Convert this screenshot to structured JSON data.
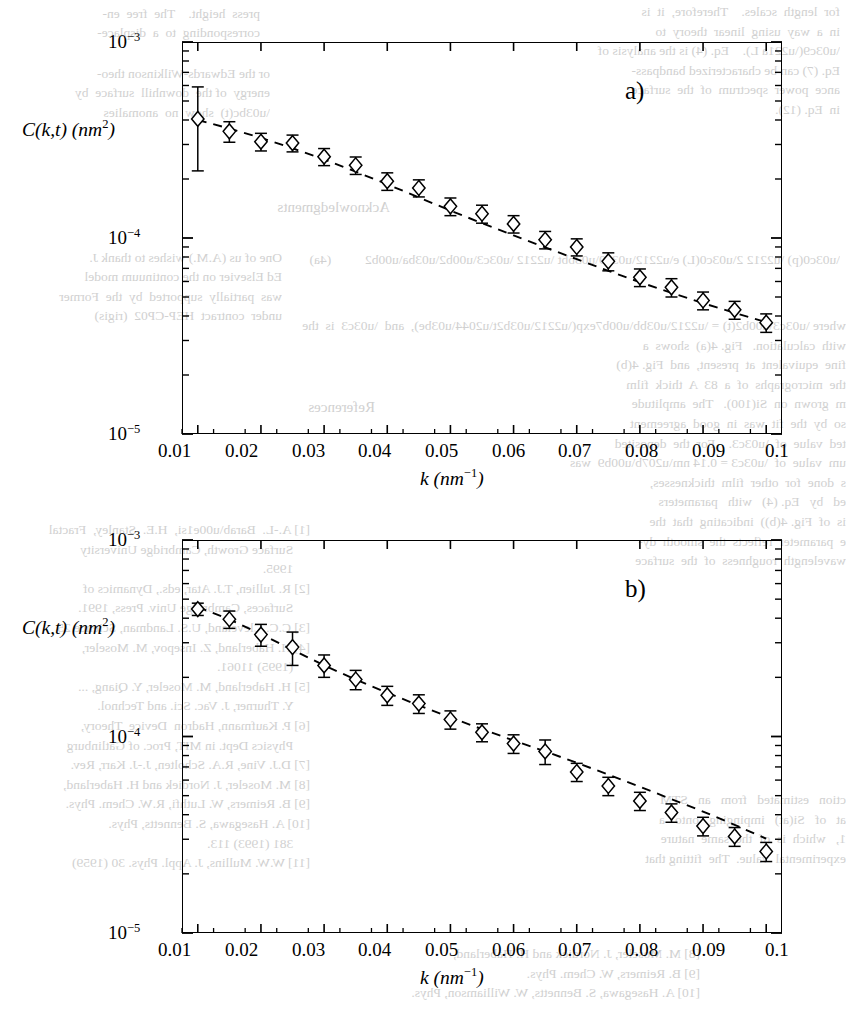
{
  "figure": {
    "kind": "scientific-figure",
    "panels": [
      {
        "id": "a",
        "label": "a)",
        "xlabel_main": "k",
        "xlabel_unit": "(nm",
        "xlabel_exp": "-1",
        "xlabel_close": ")",
        "ylabel": "C(k,t) (nm",
        "ylabel_exp": "2",
        "ylabel_close": ")"
      },
      {
        "id": "b",
        "label": "b)",
        "xlabel_main": "k",
        "xlabel_unit": "(nm",
        "xlabel_exp": "-1",
        "xlabel_close": ")",
        "ylabel": "C(k,t) (nm",
        "ylabel_exp": "2",
        "ylabel_close": ")"
      }
    ]
  },
  "chart_data": [
    {
      "type": "scatter",
      "panel": "a",
      "title": "",
      "xlabel": "k (nm^-1)",
      "ylabel": "C(k,t) (nm^2)",
      "xscale": "linear",
      "yscale": "log",
      "xlim": [
        0.0075,
        0.1025
      ],
      "ylim": [
        1e-05,
        0.001
      ],
      "xticks": [
        0.01,
        0.02,
        0.03,
        0.04,
        0.05,
        0.06,
        0.07,
        0.08,
        0.09,
        0.1
      ],
      "xticklabels": [
        "0.01",
        "0.02",
        "0.03",
        "0.04",
        "0.05",
        "0.06",
        "0.07",
        "0.08",
        "0.09",
        "0.1"
      ],
      "yticks": [
        1e-05,
        0.0001,
        0.001
      ],
      "yticklabels": [
        "10-5",
        "10-4",
        "10-3"
      ],
      "grid": false,
      "legend": null,
      "marker": "open-diamond",
      "errorbars": true,
      "x": [
        0.01,
        0.015,
        0.02,
        0.025,
        0.03,
        0.035,
        0.04,
        0.045,
        0.05,
        0.055,
        0.06,
        0.065,
        0.07,
        0.075,
        0.08,
        0.085,
        0.09,
        0.095,
        0.1
      ],
      "y": [
        0.000405,
        0.00035,
        0.00031,
        0.000305,
        0.00026,
        0.000235,
        0.000195,
        0.00018,
        0.000145,
        0.000133,
        0.000118,
        9.8e-05,
        9e-05,
        7.6e-05,
        6.3e-05,
        5.6e-05,
        4.8e-05,
        4.3e-05,
        3.7e-05
      ],
      "yerr_low": [
        0.000185,
        4.2e-05,
        3.2e-05,
        3e-05,
        2.6e-05,
        2.4e-05,
        2e-05,
        1.8e-05,
        1.5e-05,
        1.4e-05,
        1.2e-05,
        1e-05,
        9e-06,
        8e-06,
        6.5e-06,
        6e-06,
        5e-06,
        4.5e-06,
        4e-06
      ],
      "yerr_high": [
        0.000185,
        4.2e-05,
        3.2e-05,
        3e-05,
        2.6e-05,
        2.4e-05,
        2e-05,
        1.8e-05,
        1.5e-05,
        1.4e-05,
        1.2e-05,
        1e-05,
        9e-06,
        8e-06,
        6.5e-06,
        6e-06,
        5e-06,
        4.5e-06,
        4e-06
      ],
      "fit": {
        "style": "dashed",
        "x": [
          0.01,
          0.015,
          0.02,
          0.025,
          0.03,
          0.035,
          0.04,
          0.045,
          0.05,
          0.055,
          0.06,
          0.065,
          0.07,
          0.075,
          0.08,
          0.085,
          0.09,
          0.095,
          0.1
        ],
        "y": [
          0.0004,
          0.000362,
          0.000324,
          0.000287,
          0.000252,
          0.000218,
          0.000188,
          0.000161,
          0.000138,
          0.000119,
          0.000103,
          8.95e-05,
          7.8e-05,
          6.8e-05,
          5.95e-05,
          5.25e-05,
          4.65e-05,
          4.15e-05,
          3.72e-05
        ]
      }
    },
    {
      "type": "scatter",
      "panel": "b",
      "title": "",
      "xlabel": "k (nm^-1)",
      "ylabel": "C(k,t) (nm^2)",
      "xscale": "linear",
      "yscale": "log",
      "xlim": [
        0.0075,
        0.1025
      ],
      "ylim": [
        1e-05,
        0.001
      ],
      "xticks": [
        0.01,
        0.02,
        0.03,
        0.04,
        0.05,
        0.06,
        0.07,
        0.08,
        0.09,
        0.1
      ],
      "xticklabels": [
        "0.01",
        "0.02",
        "0.03",
        "0.04",
        "0.05",
        "0.06",
        "0.07",
        "0.08",
        "0.09",
        "0.1"
      ],
      "yticks": [
        1e-05,
        0.0001,
        0.001
      ],
      "yticklabels": [
        "10-5",
        "10-4",
        "10-3"
      ],
      "grid": false,
      "legend": null,
      "marker": "open-diamond",
      "errorbars": true,
      "x": [
        0.01,
        0.015,
        0.02,
        0.025,
        0.03,
        0.035,
        0.04,
        0.045,
        0.05,
        0.055,
        0.06,
        0.065,
        0.07,
        0.075,
        0.08,
        0.085,
        0.09,
        0.095,
        0.1
      ],
      "y": [
        0.000445,
        0.000395,
        0.00033,
        0.000285,
        0.00023,
        0.000195,
        0.000162,
        0.000147,
        0.000122,
        0.000105,
        9.2e-05,
        8.4e-05,
        6.6e-05,
        5.6e-05,
        4.7e-05,
        4.1e-05,
        3.5e-05,
        3.1e-05,
        2.6e-05
      ],
      "yerr_low": [
        3.2e-05,
        4e-05,
        4.2e-05,
        5.5e-05,
        3e-05,
        2.2e-05,
        1.8e-05,
        1.6e-05,
        1.3e-05,
        1.1e-05,
        1e-05,
        1.2e-05,
        7e-06,
        6e-06,
        5e-06,
        4.4e-06,
        3.8e-06,
        3.4e-06,
        2.9e-06
      ],
      "yerr_high": [
        3.2e-05,
        4e-05,
        4.2e-05,
        5.5e-05,
        3e-05,
        2.2e-05,
        1.8e-05,
        1.6e-05,
        1.3e-05,
        1.1e-05,
        1e-05,
        1.2e-05,
        7e-06,
        6e-06,
        5e-06,
        4.4e-06,
        3.8e-06,
        3.4e-06,
        2.9e-06
      ],
      "fit": {
        "style": "dashed",
        "x": [
          0.01,
          0.015,
          0.02,
          0.025,
          0.03,
          0.035,
          0.04,
          0.045,
          0.05,
          0.055,
          0.06,
          0.065,
          0.07,
          0.075,
          0.08,
          0.085,
          0.09,
          0.095,
          0.1
        ],
        "y": [
          0.000455,
          0.000395,
          0.000332,
          0.000276,
          0.00023,
          0.000195,
          0.000167,
          0.000144,
          0.000125,
          0.000109,
          9.55e-05,
          8.4e-05,
          7.35e-05,
          6.4e-05,
          5.55e-05,
          4.8e-05,
          4.15e-05,
          3.55e-05,
          3.02e-05
        ]
      }
    }
  ],
  "background_text": {
    "note": "faint show-through text from the underlying printed page",
    "top_left": "press height.   The  free   energy\ncorresponding to a displacement",
    "top_left2": "or the Edwards-Wilkinson theory\nenergy of the downhill surface is",
    "top_left3": "μ(t) show  no  ...",
    "left_ack": "Acknowledgments",
    "left_ack_body": "One of us (A.M.) wishes to thank J.\nEd Elsevier on the continuum model\nwas partially supported by the Former\nunder contract HEP-CP02 (rigis)",
    "refs_title": "References",
    "refs": [
      "[1] A.-L.  Barabási,  H.E.  Stanley,  Fractal",
      "    Surface Growth, Cambridge University",
      "    1995.",
      "[2] R. Jullien, T.J. Atar, eds., Dynamics of",
      "    Surfaces, Cambridge Univ. Press, 1991.",
      "[3] C.C. Cleveland, U.S. Landman, Science 25",
      "[4] H. Haberland, Z. Insepov, M. Moseler,",
      "    (1995) 11061.",
      "[5] H. Haberland, M. Moseler, Y. Qiang, ...",
      "    Y. Thurner, J. Vac. Sci. and Technol.",
      "[6] P. Kaufmann, Hadron  Device  Theory,",
      "    Physics Dept. in MIT, Proc. of Gatlinburg",
      "[7] D.J. Vine, R.A. Scholten, J.-J. Karr, Rev.",
      "[8] M. Moseler, J. Nordiek and H. Haberland,",
      "[9] B. Reimers, W. Luthfi, R.W. Chem. Phys.",
      "[10] A. Hasegawa, S. Bennetts, W. Williamson, Phys.",
      "     381 (1993) 113.",
      "[11] W.W. Mullins, J. Appl. Phys. 30 (1959) ..."
    ],
    "right_col": [
      "for  length  scales.    Therefore,  it  is",
      "in a  way  using  linear  theory  to",
      "ω(√ L).     Eq. (4) is the analysis of",
      "Eq. (7) can be characterized bandpass-",
      "ance power spectrum of the surface",
      "in Eq. (12)."
    ],
    "right_col2": [
      "π(p) − 2π(L)  e−ω λ t − σ²κ²          (4a)",
      "",
      "where σ²(t) = − λ · exp(−β t⁄ξ),  and  σ  is  the",
      "with calculation.  Fig. 4(a) shows a",
      "fine equivalent at present,  and Fig. 4(b)",
      "the micrographs  of  a  83  A  thick  film",
      "m grown on Si(100).  The amplitude",
      "so by the fit was in good agreement",
      "ted value of σ.   For the deposited",
      "um value of σ = 0.14 nm⁻¹ was",
      "s done  for  other  film  thicknesses,",
      "ed  by  Eq. (4)  with  parameters",
      "is of Fig. 4(b))  indicating that the",
      "e parameter reflects the smooth dy-",
      "wavelength  roughness  of  the  surface"
    ],
    "right_col3": [
      "ction  estimated  from  an  STM",
      "at  of  Si(at)  impinging  onto  a",
      "1,  which is of the same nature",
      "experimental value. The fitting that"
    ]
  }
}
